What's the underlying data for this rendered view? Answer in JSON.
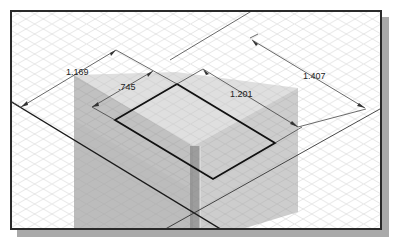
{
  "viewport": {
    "kind": "isometric-sketch-view",
    "colors": {
      "background": "#ffffff",
      "grid": "#d9d9d9",
      "plane_left": "#9a9a9a",
      "plane_right": "#a6a6a6",
      "plane_top": "#c9c9c9",
      "sketch_line": "#1a1a1a",
      "dimension_line": "#444444",
      "frame": "#2a2a2a",
      "shadow": "#a9a9a9"
    }
  },
  "dimensions": [
    {
      "id": "dim-1169",
      "value": "1.169"
    },
    {
      "id": "dim-745",
      "value": ".745"
    },
    {
      "id": "dim-1201",
      "value": "1.201"
    },
    {
      "id": "dim-1407",
      "value": "1.407"
    }
  ]
}
